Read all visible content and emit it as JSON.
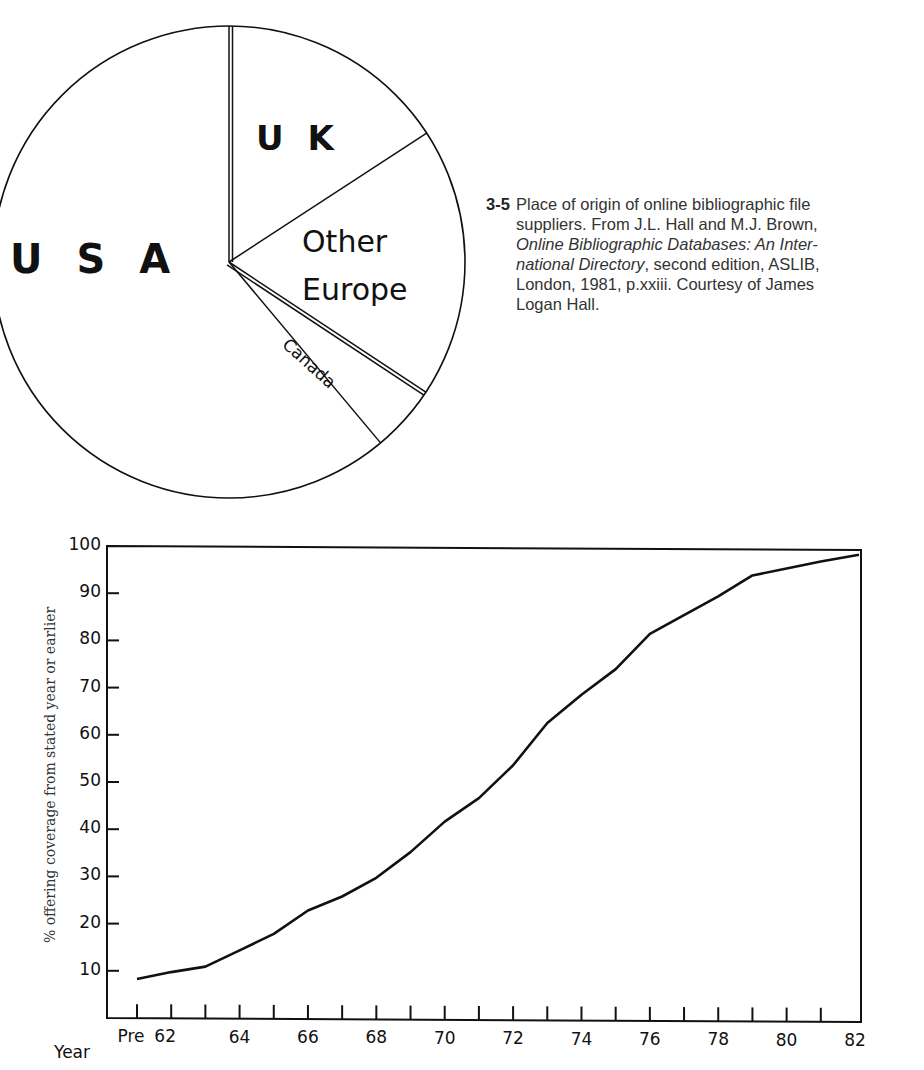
{
  "figure": {
    "number": "3-5",
    "caption_lines": [
      "Place of origin of online bibliographic file",
      "suppliers. From J.L. Hall and M.J. Brown,"
    ],
    "caption_italic_1": "Online Bibliographic Databases: An Inter-",
    "caption_italic_2": "national Directory",
    "caption_rest_2": ", second edition, ASLIB,",
    "caption_line_5": "London, 1981, p.xxiii. Courtesy of James",
    "caption_line_6": "Logan Hall."
  },
  "chart_data": [
    {
      "type": "pie",
      "title": "Place of origin of online bibliographic file suppliers",
      "labels": [
        "UK",
        "Other Europe",
        "Canada",
        "USA"
      ],
      "values": [
        15.8,
        18.5,
        4.6,
        61.1
      ],
      "display_labels": {
        "uk": "U K",
        "other_europe_1": "Other",
        "other_europe_2": "Europe",
        "canada": "Canada",
        "usa": "U S A"
      },
      "start_angle_deg": 0,
      "direction": "clockwise",
      "colors": [
        "#ffffff",
        "#ffffff",
        "#ffffff",
        "#ffffff"
      ],
      "stroke": "#111111"
    },
    {
      "type": "line",
      "title": "",
      "xlabel": "Year",
      "ylabel": "% offering coverage from stated year or earlier",
      "ylim": [
        0,
        100
      ],
      "yticks": [
        10,
        20,
        30,
        40,
        50,
        60,
        70,
        80,
        90,
        100
      ],
      "x_categories": [
        "Pre",
        "62",
        "63",
        "64",
        "65",
        "66",
        "67",
        "68",
        "69",
        "70",
        "71",
        "72",
        "73",
        "74",
        "75",
        "76",
        "77",
        "78",
        "79",
        "80",
        "81",
        "82"
      ],
      "x_tick_labels": [
        "Pre",
        "62",
        "",
        "64",
        "",
        "66",
        "",
        "68",
        "",
        "70",
        "",
        "72",
        "",
        "74",
        "",
        "76",
        "",
        "78",
        "",
        "80",
        "",
        "82"
      ],
      "series": [
        {
          "name": "% offering coverage",
          "values": [
            8.3,
            9.8,
            11,
            14.5,
            18,
            23,
            26,
            30,
            35.5,
            42,
            47,
            54,
            63,
            69,
            74.5,
            82,
            86,
            90,
            94.5,
            96,
            97.5,
            99
          ],
          "color": "#111111"
        }
      ],
      "grid": false,
      "legend": "none"
    }
  ]
}
